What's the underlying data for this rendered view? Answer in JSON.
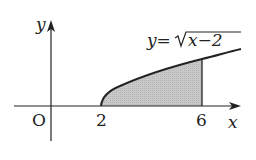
{
  "diagram": {
    "type": "function-graph-shaded-area",
    "function_label_lhs": "y=",
    "function_label_radicand": "x−2",
    "axis_labels": {
      "x": "x",
      "y": "y",
      "origin": "O"
    },
    "x_ticks": [
      {
        "value": 2,
        "label": "2"
      },
      {
        "value": 6,
        "label": "6"
      }
    ],
    "shaded_region": {
      "from": 2,
      "to": 6,
      "description": "area under y=√(x−2) between x=2 and x=6"
    },
    "colors": {
      "shade": "#c4c4c4",
      "line": "#222222"
    }
  }
}
